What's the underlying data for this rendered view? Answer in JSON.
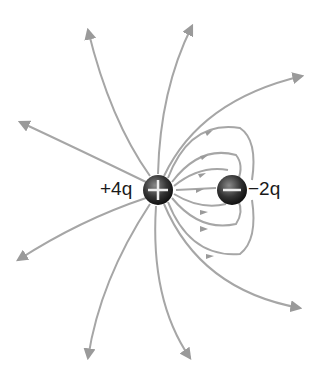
{
  "diagram": {
    "type": "electric-field-lines",
    "charges": [
      {
        "label": "+4q",
        "sign": "+",
        "x": 158,
        "y": 190
      },
      {
        "label": "−2q",
        "sign": "−",
        "x": 232,
        "y": 190
      }
    ],
    "colors": {
      "field_line": "#a0a0a0",
      "charge": "#333333"
    }
  }
}
